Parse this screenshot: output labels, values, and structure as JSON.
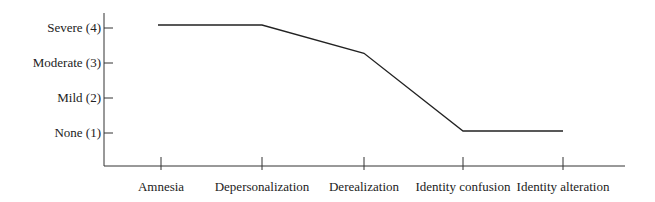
{
  "chart_data": {
    "type": "line",
    "title": "",
    "xlabel": "",
    "ylabel": "",
    "categories": [
      "Amnesia",
      "Depersonalization",
      "Derealization",
      "Identity confusion",
      "Identity alteration"
    ],
    "series": [
      {
        "name": "Severity",
        "values": [
          4,
          4,
          3.2,
          1,
          1
        ]
      }
    ],
    "y_ticks": [
      {
        "value": 4,
        "label": "Severe (4)"
      },
      {
        "value": 3,
        "label": "Moderate (3)"
      },
      {
        "value": 2,
        "label": "Mild (2)"
      },
      {
        "value": 1,
        "label": "None (1)"
      }
    ],
    "ylim": [
      0,
      4.4
    ],
    "grid": false,
    "legend": null
  },
  "axis": {
    "y_labels": [
      "Severe (4)",
      "Moderate (3)",
      "Mild (2)",
      "None (1)"
    ],
    "x_labels": [
      "Amnesia",
      "Depersonalization",
      "Derealization",
      "Identity confusion",
      "Identity alteration"
    ]
  }
}
